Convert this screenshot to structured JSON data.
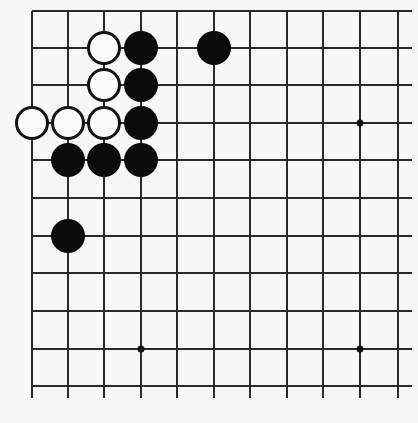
{
  "diagram": {
    "type": "go-board-partial",
    "colors": {
      "background": "#f7f7f5",
      "line": "#2a2a2a",
      "black_stone": "#0a0a0a",
      "white_stone": "#fbfbfb"
    },
    "grid": {
      "columns": 11,
      "rows": 11,
      "x_positions": [
        32,
        68,
        104,
        141,
        177,
        214,
        250,
        287,
        323,
        360,
        398
      ],
      "y_positions": [
        11,
        48,
        85,
        123,
        160,
        198,
        236,
        273,
        311,
        349,
        386
      ],
      "edges": {
        "top": true,
        "left": true,
        "right": false,
        "bottom": false
      }
    },
    "star_points": [
      {
        "col": 9,
        "row": 3
      },
      {
        "col": 3,
        "row": 9
      },
      {
        "col": 9,
        "row": 9
      }
    ],
    "stones": [
      {
        "color": "white",
        "col": 2,
        "row": 1
      },
      {
        "color": "black",
        "col": 3,
        "row": 1
      },
      {
        "color": "black",
        "col": 5,
        "row": 1
      },
      {
        "color": "white",
        "col": 2,
        "row": 2
      },
      {
        "color": "black",
        "col": 3,
        "row": 2
      },
      {
        "color": "white",
        "col": 0,
        "row": 3
      },
      {
        "color": "white",
        "col": 1,
        "row": 3
      },
      {
        "color": "white",
        "col": 2,
        "row": 3
      },
      {
        "color": "black",
        "col": 3,
        "row": 3
      },
      {
        "color": "black",
        "col": 1,
        "row": 4
      },
      {
        "color": "black",
        "col": 2,
        "row": 4
      },
      {
        "color": "black",
        "col": 3,
        "row": 4
      },
      {
        "color": "black",
        "col": 1,
        "row": 6
      }
    ]
  }
}
